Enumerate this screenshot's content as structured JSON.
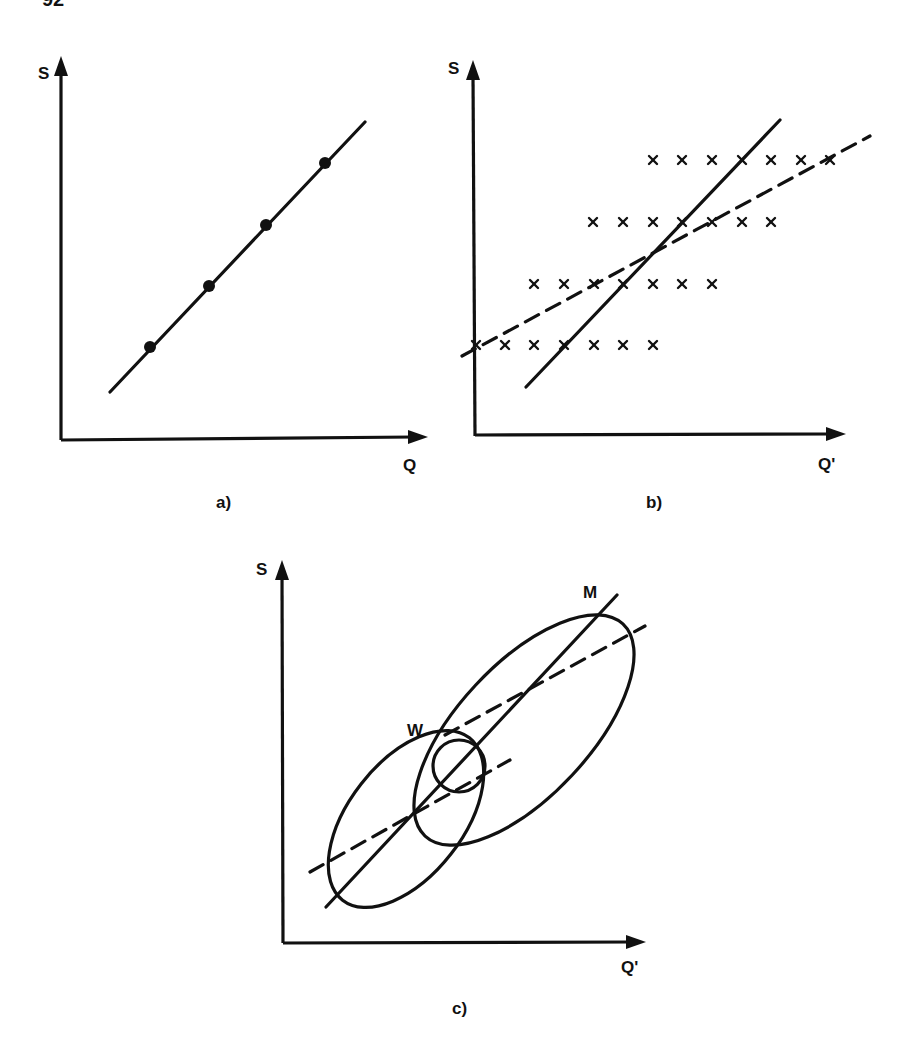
{
  "page": {
    "number": "92"
  },
  "panels": {
    "a": {
      "caption": "a)",
      "y_label": "S",
      "x_label": "Q",
      "line": {
        "x1": 110,
        "y1": 392,
        "x2": 365,
        "y2": 122
      },
      "points": [
        [
          150,
          347
        ],
        [
          209,
          286
        ],
        [
          266,
          225
        ],
        [
          325,
          163
        ]
      ]
    },
    "b": {
      "caption": "b)",
      "y_label": "S",
      "x_label": "Q'",
      "solid_line": {
        "x1": 526,
        "y1": 387,
        "x2": 780,
        "y2": 120
      },
      "dashed_line": {
        "x1": 462,
        "y1": 356,
        "x2": 870,
        "y2": 136
      },
      "rows": [
        {
          "y": 160,
          "xs": [
            653,
            682,
            712,
            742,
            771,
            801,
            830
          ]
        },
        {
          "y": 222,
          "xs": [
            593,
            623,
            653,
            682,
            712,
            742,
            771
          ]
        },
        {
          "y": 284,
          "xs": [
            534,
            564,
            594,
            623,
            653,
            682,
            712
          ]
        },
        {
          "y": 345,
          "xs": [
            476,
            505,
            534,
            564,
            594,
            623,
            653
          ]
        }
      ]
    },
    "c": {
      "caption": "c)",
      "y_label": "S",
      "x_label": "Q'",
      "group_labels": {
        "w": "W",
        "m": "M"
      },
      "solid_line": {
        "x1": 326,
        "y1": 907,
        "x2": 617,
        "y2": 595
      },
      "dashed_lines": [
        {
          "x1": 445,
          "y1": 735,
          "x2": 645,
          "y2": 626
        },
        {
          "x1": 310,
          "y1": 872,
          "x2": 510,
          "y2": 760
        }
      ],
      "ellipses": [
        {
          "name": "W",
          "cx": 406,
          "cy": 819,
          "rx": 103,
          "ry": 57,
          "rotate": -52
        },
        {
          "name": "M",
          "cx": 524,
          "cy": 730,
          "rx": 145,
          "ry": 66,
          "rotate": -47
        }
      ],
      "circle": {
        "cx": 459,
        "cy": 766,
        "r": 26
      }
    }
  },
  "chart_data": [
    {
      "type": "scatter",
      "title": "a)",
      "xlabel": "Q",
      "ylabel": "S",
      "description": "Four points lying exactly on a straight line (perfect correlation)",
      "points": [
        [
          1,
          1
        ],
        [
          2,
          2
        ],
        [
          3,
          3
        ],
        [
          4,
          4
        ]
      ],
      "fit_lines": [
        {
          "style": "solid",
          "slope": 1
        }
      ],
      "grid": false
    },
    {
      "type": "scatter",
      "title": "b)",
      "xlabel": "Q'",
      "ylabel": "S",
      "description": "Four rows of 7 'x' markers, each row shifted right as S increases; solid (steep) and dashed (shallow) regression lines cross near center",
      "series": [
        {
          "name": "S level 1",
          "x": [
            0,
            1,
            2,
            3,
            4,
            5,
            6
          ],
          "y": 1
        },
        {
          "name": "S level 2",
          "x": [
            2,
            3,
            4,
            5,
            6,
            7,
            8
          ],
          "y": 2
        },
        {
          "name": "S level 3",
          "x": [
            4,
            5,
            6,
            7,
            8,
            9,
            10
          ],
          "y": 3
        },
        {
          "name": "S level 4",
          "x": [
            6,
            7,
            8,
            9,
            10,
            11,
            12
          ],
          "y": 4
        }
      ],
      "fit_lines": [
        {
          "style": "solid",
          "label": "steep regression"
        },
        {
          "style": "dashed",
          "label": "shallow regression"
        }
      ],
      "grid": false
    },
    {
      "type": "scatter",
      "title": "c)",
      "xlabel": "Q'",
      "ylabel": "S",
      "description": "Two elliptical clusters labelled W (lower-left) and M (upper-right) with a common solid line and separate dashed within-group lines; a small circle marks the overlap",
      "groups": [
        "W",
        "M"
      ],
      "fit_lines": [
        {
          "style": "solid",
          "label": "common line"
        },
        {
          "style": "dashed",
          "label": "within-group W"
        },
        {
          "style": "dashed",
          "label": "within-group M"
        }
      ],
      "grid": false
    }
  ]
}
